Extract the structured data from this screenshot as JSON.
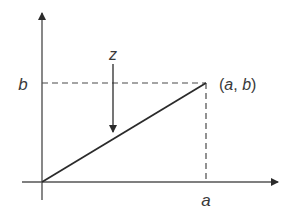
{
  "diagram": {
    "labels": {
      "y_value": "b",
      "x_value": "a",
      "point": "(a, b)",
      "arrow": "z"
    },
    "point_parts": {
      "open": "(",
      "a": "a",
      "sep": ", ",
      "b": "b",
      "close": ")"
    },
    "colors": {
      "line": "#2b2b2b",
      "dashed": "#4a4a4a",
      "text": "#3a3a3a"
    }
  }
}
